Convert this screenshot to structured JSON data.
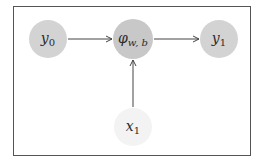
{
  "diagram": {
    "nodes": [
      {
        "id": "y0",
        "base": "y",
        "sub": "0",
        "sub_italic": false,
        "cx": 48,
        "cy": 39,
        "r": 19,
        "fill": "#d3d3d3"
      },
      {
        "id": "phi",
        "base": "φ",
        "sub": "w, b",
        "sub_italic": true,
        "cx": 133,
        "cy": 39,
        "r": 20,
        "fill": "#c8c8c8"
      },
      {
        "id": "y1",
        "base": "y",
        "sub": "1",
        "sub_italic": false,
        "cx": 219,
        "cy": 39,
        "r": 19,
        "fill": "#d3d3d3"
      },
      {
        "id": "x1",
        "base": "x",
        "sub": "1",
        "sub_italic": false,
        "cx": 133,
        "cy": 127,
        "r": 19,
        "fill": "#f3f3f3"
      }
    ],
    "edges": [
      {
        "from": "y0",
        "to": "phi"
      },
      {
        "from": "phi",
        "to": "y1"
      },
      {
        "from": "x1",
        "to": "phi"
      }
    ],
    "colors": {
      "edge": "#444444",
      "frame": "#555555",
      "text": "#2a2a2a"
    }
  }
}
